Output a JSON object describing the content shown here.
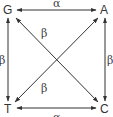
{
  "diagram": {
    "type": "substitution-model",
    "colors": {
      "line": "#333333",
      "text": "#333333",
      "background": "#ffffff"
    },
    "nodes": [
      {
        "id": "G",
        "label": "G",
        "x": 8,
        "y": 14
      },
      {
        "id": "A",
        "label": "A",
        "x": 104,
        "y": 14
      },
      {
        "id": "T",
        "label": "T",
        "x": 8,
        "y": 111
      },
      {
        "id": "C",
        "label": "C",
        "x": 104,
        "y": 111
      }
    ],
    "edges": [
      {
        "from": "G",
        "to": "A",
        "label": "α",
        "bidirectional": true
      },
      {
        "from": "T",
        "to": "C",
        "label": "α",
        "bidirectional": true
      },
      {
        "from": "G",
        "to": "T",
        "label": "β",
        "bidirectional": true
      },
      {
        "from": "A",
        "to": "C",
        "label": "β",
        "bidirectional": true
      },
      {
        "from": "G",
        "to": "C",
        "label": "β",
        "bidirectional": true
      },
      {
        "from": "T",
        "to": "A",
        "label": "β",
        "bidirectional": true
      }
    ],
    "labels": {
      "alpha_top": "α",
      "alpha_bottom": "α",
      "beta_left": "β",
      "beta_right": "β",
      "beta_diag_upper": "β",
      "beta_diag_lower": "β"
    }
  }
}
